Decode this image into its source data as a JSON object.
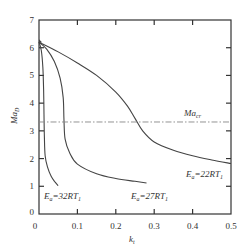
{
  "chart_data": {
    "type": "line",
    "title": "",
    "xlabel": "k_t",
    "ylabel": "Ma_D",
    "xlim": [
      0,
      0.5
    ],
    "ylim": [
      0,
      7
    ],
    "x_ticks": [
      "0",
      "0.1",
      "0.2",
      "0.3",
      "0.4",
      "0.5"
    ],
    "y_ticks": [
      "0",
      "1",
      "2",
      "3",
      "4",
      "5",
      "6",
      "7"
    ],
    "grid": false,
    "legend": "inline labels",
    "series": [
      {
        "name": "E_a=22RT_1",
        "x": [
          0,
          0.05,
          0.1,
          0.15,
          0.2,
          0.23,
          0.25,
          0.27,
          0.3,
          0.35,
          0.4,
          0.45,
          0.5
        ],
        "y": [
          6.2,
          5.85,
          5.45,
          5.0,
          4.4,
          3.9,
          3.45,
          3.0,
          2.6,
          2.3,
          2.1,
          1.95,
          1.82
        ]
      },
      {
        "name": "E_a=27RT_1",
        "x": [
          0,
          0.02,
          0.04,
          0.055,
          0.063,
          0.065,
          0.068,
          0.08,
          0.1,
          0.15,
          0.2,
          0.25,
          0.28
        ],
        "y": [
          6.2,
          5.95,
          5.5,
          4.9,
          4.2,
          3.4,
          2.7,
          2.2,
          1.8,
          1.45,
          1.28,
          1.18,
          1.12
        ]
      },
      {
        "name": "E_a=32RT_1",
        "x": [
          0,
          0.006,
          0.01,
          0.012,
          0.013,
          0.014,
          0.016,
          0.022,
          0.032,
          0.042,
          0.05
        ],
        "y": [
          6.2,
          5.9,
          5.3,
          4.5,
          3.6,
          2.8,
          2.1,
          1.7,
          1.35,
          1.15,
          1.02
        ]
      },
      {
        "name": "Ma_cr",
        "style": "dash-dot",
        "x": [
          0,
          0.5
        ],
        "y": [
          3.32,
          3.32
        ]
      }
    ],
    "annotations": [
      {
        "text": "Ma_cr",
        "x": 0.43,
        "y": 3.6
      },
      {
        "text": "E_a=22RT_1",
        "x": 0.4,
        "y": 1.35
      },
      {
        "text": "E_a=27RT_1",
        "x": 0.25,
        "y": 0.55
      },
      {
        "text": "E_a=32RT_1",
        "x": 0.06,
        "y": 0.55
      }
    ]
  },
  "labels": {
    "xlabel_main": "k",
    "xlabel_sub": "t",
    "ylabel_main": "Ma",
    "ylabel_sub": "D",
    "macr_main": "Ma",
    "macr_sub": "cr",
    "e22_main": "E",
    "e22_sub1": "a",
    "e22_mid": "=22RT",
    "e22_sub2": "1",
    "e27_main": "E",
    "e27_sub1": "a",
    "e27_mid": "=27RT",
    "e27_sub2": "1",
    "e32_main": "E",
    "e32_sub1": "a",
    "e32_mid": "=32RT",
    "e32_sub2": "1"
  },
  "colors": {
    "axis": "#333333",
    "curve": "#444444",
    "ref_line": "#888888"
  }
}
